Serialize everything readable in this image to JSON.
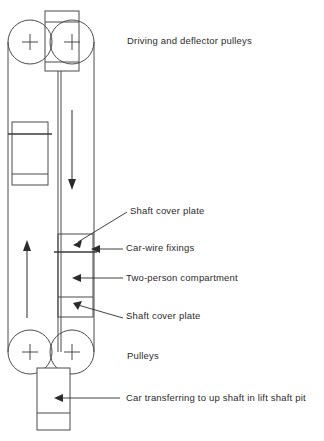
{
  "figure": {
    "type": "technical-line-diagram",
    "background_color": "#ffffff",
    "line_color": "#4a4a4a",
    "text_color": "#2b2b2b"
  },
  "labels": {
    "driving_pulleys": "Driving and deflector pulleys",
    "shaft_cover_plate_top": "Shaft cover plate",
    "car_wire_fixings": "Car-wire fixings",
    "two_person_compartment": "Two-person compartment",
    "shaft_cover_plate_bottom": "Shaft cover plate",
    "pulleys": "Pulleys",
    "car_transferring": "Car transferring to up shaft in lift shaft pit"
  },
  "parts": {
    "top_pulley_left": "pulley-wheel-top-left",
    "top_pulley_right": "pulley-wheel-top-right",
    "top_machine_block": "driving-machine-housing",
    "bottom_pulley_left": "pulley-wheel-bottom-left",
    "bottom_pulley_right": "pulley-wheel-bottom-right",
    "upper_car": "car-compartment-upper-left",
    "middle_car": "car-compartment-middle-right",
    "bottom_car": "car-compartment-bottom",
    "down_arrow": "descending-direction-arrow",
    "up_arrow": "ascending-direction-arrow",
    "rope_left": "hoist-rope-left",
    "rope_right": "hoist-rope-right"
  }
}
